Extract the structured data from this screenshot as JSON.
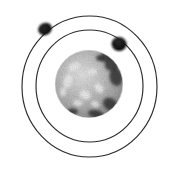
{
  "figure": {
    "title": "Bohr model of the atom",
    "kind": "scientific-illustration",
    "width": 175,
    "height": 172,
    "background_color": "#ffffff",
    "style": "grainy halftone scan, black line art",
    "labels": [],
    "annotations": []
  },
  "colors": {
    "background": "#ffffff",
    "orbit_stroke": "#2b2b2b",
    "electron_fill": "#111111",
    "nucleus_mid": "#b9b9b9",
    "nucleus_light": "#efefef",
    "nucleus_dark": "#2e2e2e",
    "nucleus_rim": "#8d8d8d"
  },
  "orbits": [
    {
      "name": "outer-orbit",
      "cx": 89.5,
      "cy": 86.5,
      "rx": 67.5,
      "ry": 70.5,
      "stroke_width": 1.15
    },
    {
      "name": "inner-orbit",
      "cx": 89.5,
      "cy": 86.0,
      "rx": 53.5,
      "ry": 56.0,
      "stroke_width": 1.15
    }
  ],
  "nucleus": {
    "name": "nucleus",
    "cx": 89,
    "cy": 84,
    "r": 33.5,
    "texture": "mottled-dithered-sphere",
    "highlight_spots": [
      {
        "cx": 74,
        "cy": 67,
        "rx": 6.5,
        "ry": 4.0,
        "rot": -28
      },
      {
        "cx": 68,
        "cy": 81,
        "rx": 4.5,
        "ry": 7.5,
        "rot": 14
      },
      {
        "cx": 92,
        "cy": 72,
        "rx": 5.0,
        "ry": 3.2,
        "rot": -12
      },
      {
        "cx": 85,
        "cy": 95,
        "rx": 6.0,
        "ry": 4.5,
        "rot": 22
      },
      {
        "cx": 99,
        "cy": 88,
        "rx": 4.0,
        "ry": 5.5,
        "rot": -40
      },
      {
        "cx": 78,
        "cy": 103,
        "rx": 5.0,
        "ry": 3.0,
        "rot": 8
      },
      {
        "cx": 63,
        "cy": 92,
        "rx": 3.0,
        "ry": 4.2,
        "rot": 0
      },
      {
        "cx": 95,
        "cy": 104,
        "rx": 4.0,
        "ry": 2.8,
        "rot": 30
      }
    ],
    "dark_patches": [
      {
        "cx": 113,
        "cy": 63,
        "rx": 9.0,
        "ry": 7.0,
        "rot": -35
      },
      {
        "cx": 116,
        "cy": 77,
        "rx": 6.5,
        "ry": 9.0,
        "rot": -10
      },
      {
        "cx": 106,
        "cy": 56,
        "rx": 7.0,
        "ry": 4.5,
        "rot": -45
      },
      {
        "cx": 110,
        "cy": 104,
        "rx": 7.5,
        "ry": 6.0,
        "rot": 35
      },
      {
        "cx": 96,
        "cy": 114,
        "rx": 8.0,
        "ry": 4.0,
        "rot": 12
      },
      {
        "cx": 72,
        "cy": 112,
        "rx": 6.0,
        "ry": 3.5,
        "rot": -8
      },
      {
        "cx": 100,
        "cy": 58,
        "rx": 4.0,
        "ry": 3.0,
        "rot": 0
      }
    ]
  },
  "electrons": [
    {
      "name": "electron-outer-upper-left",
      "orbit": "outer-orbit",
      "cx": 45,
      "cy": 29,
      "rx": 7.0,
      "ry": 6.0,
      "rot": -25
    },
    {
      "name": "electron-inner-upper-right",
      "orbit": "inner-orbit",
      "cx": 119,
      "cy": 44,
      "rx": 7.5,
      "ry": 7.0,
      "rot": 10
    }
  ]
}
